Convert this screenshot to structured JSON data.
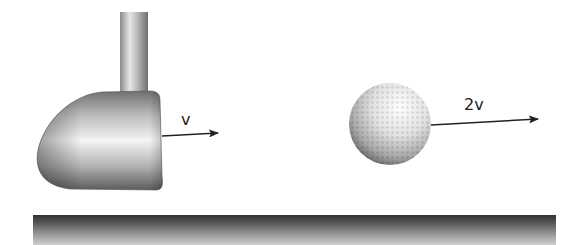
{
  "diagram": {
    "club": {
      "label": "v",
      "arrow_direction": "right"
    },
    "ball": {
      "label": "2v",
      "arrow_direction": "right"
    },
    "colors": {
      "arrow": "#222222",
      "ground_top": "#333333",
      "ground_bottom": "#cfcfcf",
      "club_metal": "#aaaaaa",
      "ball": "#dddddd"
    }
  }
}
